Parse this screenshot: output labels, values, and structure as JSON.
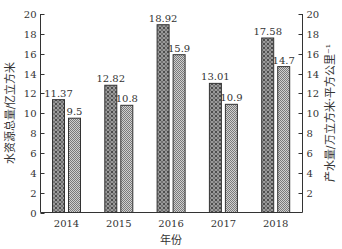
{
  "chart_data": {
    "type": "bar",
    "title": "",
    "categories": [
      "2014",
      "2015",
      "2016",
      "2017",
      "2018"
    ],
    "series": [
      {
        "name": "水资源总量",
        "axis": "left",
        "pattern": "crosshatch-dark",
        "values": [
          11.37,
          12.82,
          18.92,
          13.01,
          17.58
        ],
        "labels": [
          "11.37",
          "12.82",
          "18.92",
          "13.01",
          "17.58"
        ]
      },
      {
        "name": "产水量",
        "axis": "right",
        "pattern": "checker-light",
        "values": [
          9.5,
          10.8,
          15.9,
          10.9,
          14.7
        ],
        "labels": [
          "9.5",
          "10.8",
          "15.9",
          "10.9",
          "14.7"
        ]
      }
    ],
    "xlabel": "年份",
    "ylabel": "水资源总量/亿立方米",
    "y2label": "产水量/万立方米·平方公里⁻¹",
    "ylim": [
      0,
      20
    ],
    "y2lim": [
      0,
      20
    ],
    "yticks": [
      "0",
      "2",
      "4",
      "6",
      "8",
      "10",
      "12",
      "14",
      "16",
      "18",
      "20"
    ],
    "y2ticks": [
      "2",
      "4",
      "6",
      "8",
      "10",
      "12",
      "14",
      "16",
      "18",
      "20"
    ],
    "grid": false,
    "legend": "none",
    "colors": {
      "axis": "#333333",
      "bar1_fill": "#8a8a8a",
      "bar2_fill": "#b5b5b5",
      "bar_edge": "#333333"
    }
  }
}
